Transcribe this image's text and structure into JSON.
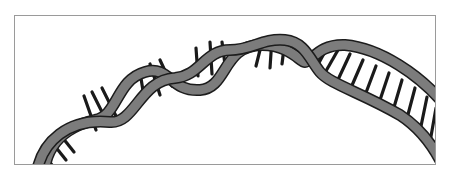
{
  "figure": {
    "frame": {
      "x": 14,
      "y": 15,
      "width": 422,
      "height": 150,
      "border_color": "#9a9a9a"
    },
    "colors": {
      "background": "#ffffff",
      "strand_fill": "#7c7c7c",
      "strand_outline": "#1c1c1c",
      "rung": "#1a1a1a"
    },
    "strand_width": 9,
    "outline_width": 12,
    "rung_width": 3.2,
    "strands": {
      "strand_a": "M 36 178 C 40 140, 70 118, 110 122 C 135 124, 140 80, 175 78 C 200 76, 205 50, 230 50 C 252 50, 262 38, 285 40 C 305 42, 310 60, 320 72 C 330 84, 360 92, 400 115 C 420 128, 432 145, 440 160",
      "strand_b": "M 44 178 C 44 150, 60 128, 95 120 C 118 116, 116 80, 145 72 C 170 65, 170 92, 200 90 C 228 88, 222 45, 262 45 C 290 45, 300 62, 305 62 C 312 62, 318 44, 345 45 C 380 48, 420 75, 445 105"
    },
    "helix_rungs": [
      [
        42,
        152,
        52,
        165
      ],
      [
        50,
        140,
        66,
        160
      ],
      [
        58,
        132,
        74,
        152
      ],
      [
        84,
        96,
        96,
        130
      ],
      [
        92,
        92,
        108,
        124
      ],
      [
        102,
        88,
        116,
        116
      ],
      [
        140,
        72,
        144,
        97
      ],
      [
        150,
        64,
        160,
        95
      ],
      [
        160,
        60,
        172,
        86
      ],
      [
        196,
        48,
        198,
        76
      ],
      [
        210,
        42,
        212,
        74
      ],
      [
        222,
        42,
        226,
        72
      ],
      [
        262,
        42,
        256,
        66
      ],
      [
        272,
        38,
        270,
        68
      ],
      [
        285,
        40,
        282,
        64
      ]
    ],
    "ladder_rungs": [
      [
        327,
        48,
        315,
        70
      ],
      [
        338,
        50,
        322,
        78
      ],
      [
        350,
        54,
        336,
        84
      ],
      [
        363,
        60,
        350,
        90
      ],
      [
        376,
        66,
        364,
        98
      ],
      [
        389,
        73,
        378,
        106
      ],
      [
        402,
        80,
        392,
        114
      ],
      [
        415,
        88,
        406,
        122
      ],
      [
        427,
        97,
        420,
        131
      ],
      [
        436,
        108,
        430,
        142
      ]
    ]
  }
}
